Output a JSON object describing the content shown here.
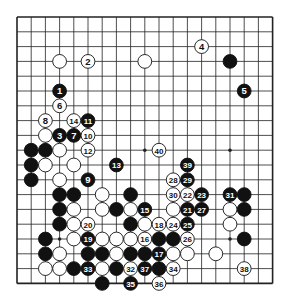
{
  "diagram": {
    "type": "go-board",
    "size": 19,
    "colors": {
      "black": "#111111",
      "white": "#ffffff",
      "line": "#222222",
      "background": "#ffffff"
    },
    "star_points": [
      [
        3,
        3
      ],
      [
        9,
        3
      ],
      [
        15,
        3
      ],
      [
        3,
        9
      ],
      [
        9,
        9
      ],
      [
        15,
        9
      ],
      [
        3,
        15
      ],
      [
        9,
        15
      ],
      [
        15,
        15
      ]
    ],
    "numbered_stones": [
      {
        "n": "1",
        "color": "black",
        "col": 3,
        "row": 5
      },
      {
        "n": "2",
        "color": "white",
        "col": 5,
        "row": 3
      },
      {
        "n": "3",
        "color": "black",
        "col": 3,
        "row": 8
      },
      {
        "n": "4",
        "color": "white",
        "col": 13,
        "row": 2
      },
      {
        "n": "5",
        "color": "black",
        "col": 16,
        "row": 5
      },
      {
        "n": "6",
        "color": "white",
        "col": 3,
        "row": 6
      },
      {
        "n": "7",
        "color": "black",
        "col": 4,
        "row": 8
      },
      {
        "n": "8",
        "color": "white",
        "col": 2,
        "row": 7
      },
      {
        "n": "9",
        "color": "black",
        "col": 5,
        "row": 11
      },
      {
        "n": "10",
        "color": "white",
        "col": 5,
        "row": 8
      },
      {
        "n": "11",
        "color": "black",
        "col": 5,
        "row": 7
      },
      {
        "n": "12",
        "color": "white",
        "col": 5,
        "row": 9
      },
      {
        "n": "13",
        "color": "black",
        "col": 7,
        "row": 10
      },
      {
        "n": "14",
        "color": "white",
        "col": 4,
        "row": 7
      },
      {
        "n": "15",
        "color": "black",
        "col": 9,
        "row": 13
      },
      {
        "n": "16",
        "color": "white",
        "col": 9,
        "row": 15
      },
      {
        "n": "17",
        "color": "black",
        "col": 10,
        "row": 16
      },
      {
        "n": "18",
        "color": "white",
        "col": 10,
        "row": 14
      },
      {
        "n": "19",
        "color": "black",
        "col": 5,
        "row": 15
      },
      {
        "n": "20",
        "color": "white",
        "col": 5,
        "row": 14
      },
      {
        "n": "21",
        "color": "black",
        "col": 12,
        "row": 13
      },
      {
        "n": "22",
        "color": "white",
        "col": 12,
        "row": 12
      },
      {
        "n": "23",
        "color": "black",
        "col": 13,
        "row": 12
      },
      {
        "n": "24",
        "color": "white",
        "col": 11,
        "row": 14
      },
      {
        "n": "25",
        "color": "black",
        "col": 12,
        "row": 14
      },
      {
        "n": "26",
        "color": "white",
        "col": 12,
        "row": 15
      },
      {
        "n": "27",
        "color": "black",
        "col": 13,
        "row": 13
      },
      {
        "n": "28",
        "color": "white",
        "col": 11,
        "row": 11
      },
      {
        "n": "29",
        "color": "black",
        "col": 12,
        "row": 11
      },
      {
        "n": "30",
        "color": "white",
        "col": 11,
        "row": 12
      },
      {
        "n": "31",
        "color": "black",
        "col": 15,
        "row": 12
      },
      {
        "n": "32",
        "color": "white",
        "col": 8,
        "row": 17
      },
      {
        "n": "33",
        "color": "black",
        "col": 5,
        "row": 17
      },
      {
        "n": "34",
        "color": "white",
        "col": 11,
        "row": 17
      },
      {
        "n": "35",
        "color": "black",
        "col": 8,
        "row": 18
      },
      {
        "n": "36",
        "color": "white",
        "col": 10,
        "row": 18
      },
      {
        "n": "37",
        "color": "black",
        "col": 9,
        "row": 17
      },
      {
        "n": "38",
        "color": "white",
        "col": 16,
        "row": 17
      },
      {
        "n": "39",
        "color": "black",
        "col": 12,
        "row": 10
      },
      {
        "n": "40",
        "color": "white",
        "col": 10,
        "row": 9
      }
    ],
    "black_stones": [
      [
        15,
        3
      ],
      [
        1,
        9
      ],
      [
        2,
        9
      ],
      [
        1,
        10
      ],
      [
        1,
        11
      ],
      [
        3,
        12
      ],
      [
        4,
        12
      ],
      [
        8,
        12
      ],
      [
        3,
        13
      ],
      [
        7,
        13
      ],
      [
        3,
        14
      ],
      [
        8,
        14
      ],
      [
        2,
        15
      ],
      [
        10,
        15
      ],
      [
        11,
        15
      ],
      [
        2,
        16
      ],
      [
        5,
        16
      ],
      [
        6,
        16
      ],
      [
        8,
        16
      ],
      [
        9,
        16
      ],
      [
        4,
        17
      ],
      [
        7,
        17
      ],
      [
        10,
        17
      ],
      [
        6,
        18
      ],
      [
        16,
        12
      ],
      [
        16,
        13
      ],
      [
        16,
        15
      ]
    ],
    "white_stones": [
      [
        3,
        3
      ],
      [
        9,
        3
      ],
      [
        2,
        8
      ],
      [
        3,
        9
      ],
      [
        2,
        10
      ],
      [
        4,
        10
      ],
      [
        3,
        11
      ],
      [
        6,
        12
      ],
      [
        4,
        13
      ],
      [
        6,
        13
      ],
      [
        8,
        13
      ],
      [
        11,
        13
      ],
      [
        4,
        14
      ],
      [
        9,
        14
      ],
      [
        4,
        15
      ],
      [
        6,
        15
      ],
      [
        7,
        15
      ],
      [
        8,
        15
      ],
      [
        3,
        16
      ],
      [
        7,
        16
      ],
      [
        11,
        16
      ],
      [
        12,
        16
      ],
      [
        2,
        17
      ],
      [
        3,
        17
      ],
      [
        6,
        17
      ],
      [
        15,
        13
      ],
      [
        15,
        14
      ],
      [
        14,
        16
      ]
    ]
  }
}
